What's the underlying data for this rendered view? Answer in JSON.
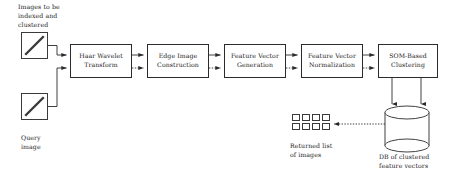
{
  "diagram": {
    "background_color": "#ffffff",
    "stroke_color": "#2b2b2b",
    "text_color": "#1a1a1a",
    "process_boxes": [
      {
        "id": "haar",
        "label_lines": [
          "Haar Wavelet",
          "Transform"
        ],
        "x": 70,
        "y": 44,
        "w": 62,
        "h": 34
      },
      {
        "id": "edge",
        "label_lines": [
          "Edge Image",
          "Construction"
        ],
        "x": 147,
        "y": 44,
        "w": 62,
        "h": 34
      },
      {
        "id": "fvgen",
        "label_lines": [
          "Feature Vector",
          "Generation"
        ],
        "x": 224,
        "y": 44,
        "w": 62,
        "h": 34
      },
      {
        "id": "fvnorm",
        "label_lines": [
          "Feature Vector",
          "Normalization"
        ],
        "x": 301,
        "y": 44,
        "w": 62,
        "h": 34
      },
      {
        "id": "som",
        "label_lines": [
          "SOM-Based",
          "Clustering"
        ],
        "x": 378,
        "y": 44,
        "w": 60,
        "h": 34
      }
    ],
    "captions": [
      {
        "id": "indexed-images-label",
        "lines": [
          "Images to be",
          "indexed and",
          "clustered"
        ],
        "x": 18,
        "y": 3
      },
      {
        "id": "query-image-label",
        "lines": [
          "Query",
          "image"
        ],
        "x": 21,
        "y": 134
      },
      {
        "id": "returned-list-label",
        "lines": [
          "Returned list",
          "of images"
        ],
        "x": 290,
        "y": 142
      },
      {
        "id": "db-label",
        "lines": [
          "DB of clustered",
          "feature vectors"
        ],
        "x": 379,
        "y": 153
      }
    ],
    "image_icons": [
      {
        "id": "indexed-images-icon",
        "x": 21,
        "y": 32,
        "w": 27,
        "h": 27
      },
      {
        "id": "query-image-icon",
        "x": 21,
        "y": 93,
        "w": 27,
        "h": 27
      }
    ],
    "returned_thumbnails": {
      "id": "returned-list-grid",
      "x": 292,
      "y": 114,
      "columns": 4,
      "rows": 2,
      "cell_w": 8,
      "cell_h": 7,
      "gap": 2
    },
    "database": {
      "id": "db-clustered-feature-vectors",
      "x": 385,
      "y": 106,
      "w": 44,
      "h": 46,
      "ellipse_ry": 6.5
    },
    "edge_styles": {
      "indexing_path": "solid",
      "query_path": "dotted",
      "retrieval_path": "dotted"
    }
  }
}
